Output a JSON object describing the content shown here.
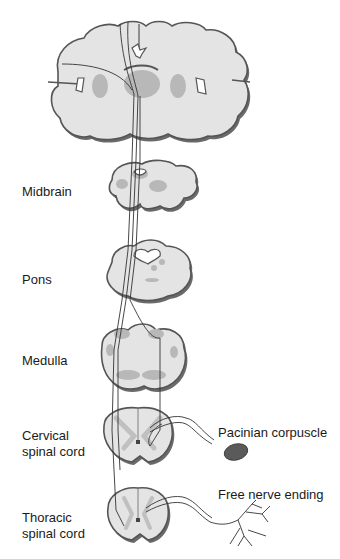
{
  "diagram": {
    "type": "neuroanatomy-pathway",
    "levels": [
      {
        "id": "cortex",
        "label": ""
      },
      {
        "id": "midbrain",
        "label": "Midbrain"
      },
      {
        "id": "pons",
        "label": "Pons"
      },
      {
        "id": "medulla",
        "label": "Medulla"
      },
      {
        "id": "cervical",
        "label": "Cervical\nspinal cord",
        "line1": "Cervical",
        "line2": "spinal cord"
      },
      {
        "id": "thoracic",
        "label": "Thoracic\nspinal cord",
        "line1": "Thoracic",
        "line2": "spinal cord"
      }
    ],
    "receptors": [
      {
        "id": "pacinian",
        "label": "Pacinian corpuscle"
      },
      {
        "id": "free",
        "label": "Free nerve ending"
      }
    ],
    "colors": {
      "tissue": "#e4e4e4",
      "outline": "#555555",
      "shadow": "#6a6a6a",
      "nucleus": "#b8b8b8",
      "corpuscle": "#5a5a5a",
      "tract": "#333333"
    }
  }
}
